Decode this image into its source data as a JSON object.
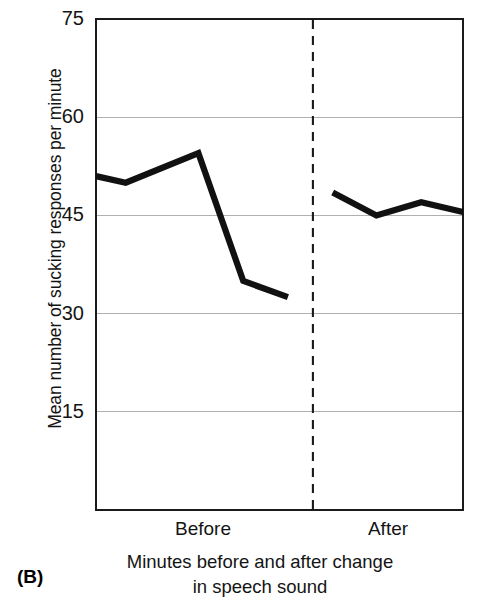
{
  "figure": {
    "panel_letter": "(B)",
    "line_color": "#111111",
    "axis_color": "#1a1a1a",
    "grid_color": "#b4b4b4",
    "divider_color": "#1a1a1a",
    "background": "#ffffff"
  },
  "chart_data": {
    "type": "line",
    "title": "",
    "xlabel": "Minutes before and after change in speech sound",
    "xlabel_line1": "Minutes before and after change",
    "xlabel_line2": "in speech sound",
    "ylabel": "Mean number of sucking responses per minute",
    "ylim": [
      0,
      75
    ],
    "yticks": [
      75,
      60,
      45,
      30,
      15
    ],
    "ytick_labels": [
      "75",
      "60",
      "45",
      "30",
      "15"
    ],
    "grid": true,
    "grid_axis": "y",
    "legend": false,
    "x_section_labels": [
      "Before",
      "After"
    ],
    "annotations": [
      {
        "name": "change-divider",
        "type": "vertical-dashed-line",
        "label": "change in speech sound",
        "x_fraction": 0.591
      }
    ],
    "series": [
      {
        "name": "Before change",
        "x": [
          0,
          1,
          2,
          3,
          4
        ],
        "x_fraction": [
          0.0,
          0.081,
          0.279,
          0.401,
          0.523
        ],
        "values": [
          51,
          50,
          54.5,
          35,
          32.5
        ]
      },
      {
        "name": "After change",
        "x": [
          5,
          6,
          7,
          8
        ],
        "x_fraction": [
          0.645,
          0.764,
          0.886,
          1.0
        ],
        "values": [
          48.5,
          45,
          47,
          45.5
        ]
      }
    ]
  }
}
